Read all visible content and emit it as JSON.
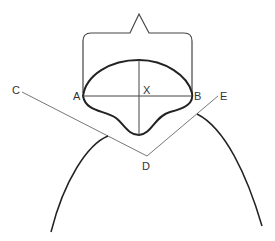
{
  "diagram": {
    "labels": {
      "A": "A",
      "B": "B",
      "C": "C",
      "D": "D",
      "E": "E",
      "X": "X"
    },
    "colors": {
      "stroke_dark": "#222222",
      "stroke_light": "#777777",
      "label": "#333333",
      "background": "#ffffff"
    }
  }
}
